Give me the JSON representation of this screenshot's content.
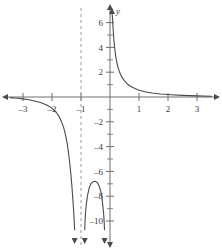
{
  "figure": {
    "background_color": "#ffffff",
    "axis_color": "#6e6e6e",
    "curve_color": "#4a4a4a",
    "asymptote_color": "#9a9a9a",
    "label_color": "#3a3a3a"
  },
  "chart_data": {
    "type": "line",
    "title": "",
    "xlabel": "",
    "ylabel": "y",
    "xlim": [
      -3.45,
      3.55
    ],
    "ylim": [
      -10.8,
      6.9
    ],
    "grid": false,
    "legend": null,
    "x_axis": {
      "name": "",
      "major_ticks": [
        -3,
        -2,
        -1,
        1,
        2,
        3
      ],
      "tick_labels": [
        "–3",
        "–2",
        "–1",
        "1",
        "2",
        "3"
      ],
      "arrows": [
        "left",
        "right"
      ]
    },
    "y_axis": {
      "name": "y",
      "major_ticks": [
        6,
        4,
        2,
        -2,
        -4,
        -6,
        -8,
        -10
      ],
      "tick_labels": [
        "6",
        "4",
        "2",
        "–2",
        "–4",
        "–6",
        "–8",
        "–10"
      ],
      "minor_ticks": [
        5,
        3,
        1,
        -1,
        -3,
        -5,
        -7,
        -9
      ],
      "arrows": [
        "up",
        "down"
      ]
    },
    "asymptotes": [
      {
        "kind": "vertical",
        "x": -1,
        "style": "dashed",
        "label": ""
      },
      {
        "kind": "vertical",
        "x": 0,
        "style": "none",
        "label": ""
      },
      {
        "kind": "horizontal",
        "y": 0,
        "style": "none",
        "label": ""
      }
    ],
    "series": [
      {
        "name": "left-branch",
        "style": "solid",
        "end_arrow": "down",
        "points": [
          [
            -3.45,
            -0.05
          ],
          [
            -3.2,
            -0.1
          ],
          [
            -3.0,
            -0.15
          ],
          [
            -2.8,
            -0.22
          ],
          [
            -2.6,
            -0.32
          ],
          [
            -2.4,
            -0.45
          ],
          [
            -2.2,
            -0.62
          ],
          [
            -2.05,
            -0.82
          ],
          [
            -1.95,
            -1.0
          ],
          [
            -1.85,
            -1.25
          ],
          [
            -1.75,
            -1.6
          ],
          [
            -1.68,
            -1.95
          ],
          [
            -1.6,
            -2.45
          ],
          [
            -1.54,
            -3.0
          ],
          [
            -1.48,
            -3.7
          ],
          [
            -1.43,
            -4.5
          ],
          [
            -1.39,
            -5.3
          ],
          [
            -1.35,
            -6.2
          ],
          [
            -1.31,
            -7.3
          ],
          [
            -1.28,
            -8.3
          ],
          [
            -1.25,
            -9.3
          ],
          [
            -1.23,
            -10.2
          ],
          [
            -1.22,
            -10.7
          ]
        ]
      },
      {
        "name": "middle-branch",
        "style": "solid",
        "end_arrow": "down-both",
        "points": [
          [
            -0.87,
            -10.7
          ],
          [
            -0.86,
            -10.0
          ],
          [
            -0.84,
            -9.2
          ],
          [
            -0.81,
            -8.5
          ],
          [
            -0.77,
            -7.9
          ],
          [
            -0.72,
            -7.35
          ],
          [
            -0.66,
            -7.0
          ],
          [
            -0.58,
            -6.82
          ],
          [
            -0.5,
            -6.8
          ],
          [
            -0.43,
            -6.92
          ],
          [
            -0.37,
            -7.2
          ],
          [
            -0.32,
            -7.6
          ],
          [
            -0.28,
            -8.1
          ],
          [
            -0.25,
            -8.7
          ],
          [
            -0.22,
            -9.4
          ],
          [
            -0.2,
            -10.1
          ],
          [
            -0.19,
            -10.7
          ]
        ]
      },
      {
        "name": "right-branch",
        "style": "solid",
        "end_arrow": "up",
        "points": [
          [
            0.07,
            6.85
          ],
          [
            0.09,
            6.2
          ],
          [
            0.11,
            5.4
          ],
          [
            0.13,
            4.7
          ],
          [
            0.16,
            4.0
          ],
          [
            0.19,
            3.4
          ],
          [
            0.23,
            2.85
          ],
          [
            0.28,
            2.35
          ],
          [
            0.34,
            1.95
          ],
          [
            0.41,
            1.6
          ],
          [
            0.5,
            1.3
          ],
          [
            0.6,
            1.05
          ],
          [
            0.72,
            0.85
          ],
          [
            0.86,
            0.68
          ],
          [
            1.0,
            0.55
          ],
          [
            1.2,
            0.42
          ],
          [
            1.45,
            0.32
          ],
          [
            1.75,
            0.24
          ],
          [
            2.1,
            0.18
          ],
          [
            2.5,
            0.13
          ],
          [
            3.0,
            0.09
          ],
          [
            3.5,
            0.06
          ]
        ]
      }
    ]
  }
}
